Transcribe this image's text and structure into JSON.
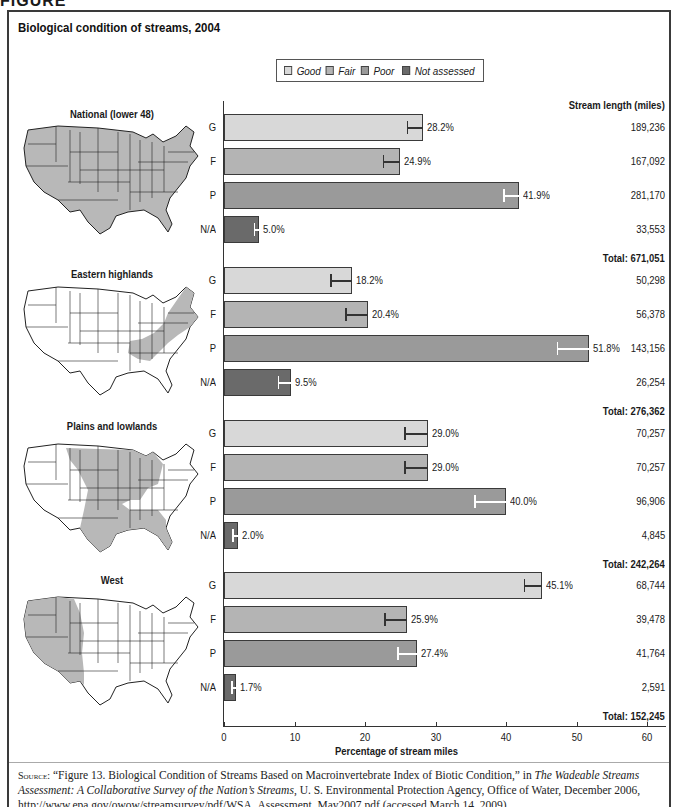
{
  "title": "Biological condition of streams, 2004",
  "legend": [
    {
      "label": "Good",
      "color": "#d8d8d8"
    },
    {
      "label": "Fair",
      "color": "#b4b4b4"
    },
    {
      "label": "Poor",
      "color": "#9a9a9a"
    },
    {
      "label": "Not assessed",
      "color": "#6a6a6a"
    }
  ],
  "column_header": "Stream length (miles)",
  "x_axis": {
    "title": "Percentage of stream miles",
    "ticks": [
      "0",
      "10",
      "20",
      "30",
      "40",
      "50",
      "60"
    ]
  },
  "regions": [
    {
      "name": "National (lower 48)",
      "rows": [
        {
          "cat": "G",
          "pct": "28.2%",
          "miles": "189,236"
        },
        {
          "cat": "F",
          "pct": "24.9%",
          "miles": "167,092"
        },
        {
          "cat": "P",
          "pct": "41.9%",
          "miles": "281,170"
        },
        {
          "cat": "N/A",
          "pct": "5.0%",
          "miles": "33,553"
        }
      ],
      "total": "Total: 671,051"
    },
    {
      "name": "Eastern highlands",
      "rows": [
        {
          "cat": "G",
          "pct": "18.2%",
          "miles": "50,298"
        },
        {
          "cat": "F",
          "pct": "20.4%",
          "miles": "56,378"
        },
        {
          "cat": "P",
          "pct": "51.8%",
          "miles": "143,156"
        },
        {
          "cat": "N/A",
          "pct": "9.5%",
          "miles": "26,254"
        }
      ],
      "total": "Total: 276,362"
    },
    {
      "name": "Plains and lowlands",
      "rows": [
        {
          "cat": "G",
          "pct": "29.0%",
          "miles": "70,257"
        },
        {
          "cat": "F",
          "pct": "29.0%",
          "miles": "70,257"
        },
        {
          "cat": "P",
          "pct": "40.0%",
          "miles": "96,906"
        },
        {
          "cat": "N/A",
          "pct": "2.0%",
          "miles": "4,845"
        }
      ],
      "total": "Total: 242,264"
    },
    {
      "name": "West",
      "rows": [
        {
          "cat": "G",
          "pct": "45.1%",
          "miles": "68,744"
        },
        {
          "cat": "F",
          "pct": "25.9%",
          "miles": "39,478"
        },
        {
          "cat": "P",
          "pct": "27.4%",
          "miles": "41,764"
        },
        {
          "cat": "N/A",
          "pct": "1.7%",
          "miles": "2,591"
        }
      ],
      "total": "Total: 152,245"
    }
  ],
  "source": {
    "prefix": "Source:",
    "part1": " “Figure 13. Biological Condition of Streams Based on Macroinvertebrate Index of Biotic Condition,” in ",
    "italic": "The Wadeable Streams Assessment: A Collaborative Survey of the Nation’s Streams",
    "part2": ", U. S. Environmental Protection Agency, Office of Water, December 2006, http://www.epa.gov/owow/streamsurvey/pdf/WSA_Assessment_May2007.pdf (accessed March 14, 2009)"
  },
  "chart_data": {
    "type": "bar",
    "orientation": "horizontal",
    "title": "Biological condition of streams, 2004",
    "xlabel": "Percentage of stream miles",
    "ylabel": "",
    "xlim": [
      0,
      60
    ],
    "xticks": [
      0,
      10,
      20,
      30,
      40,
      50,
      60
    ],
    "grid": false,
    "legend_position": "top",
    "categories": [
      "Good",
      "Fair",
      "Poor",
      "Not assessed"
    ],
    "category_abbrev": [
      "G",
      "F",
      "P",
      "N/A"
    ],
    "series": [
      {
        "name": "National (lower 48)",
        "values": [
          28.2,
          24.9,
          41.9,
          5.0
        ],
        "error_low": [
          25.9,
          22.5,
          39.6,
          4.2
        ],
        "stream_miles": [
          189236,
          167092,
          281170,
          33553
        ],
        "total_miles": 671051
      },
      {
        "name": "Eastern highlands",
        "values": [
          18.2,
          20.4,
          51.8,
          9.5
        ],
        "error_low": [
          15.1,
          17.2,
          47.2,
          7.6
        ],
        "stream_miles": [
          50298,
          56378,
          143156,
          26254
        ],
        "total_miles": 276362
      },
      {
        "name": "Plains and lowlands",
        "values": [
          29.0,
          29.0,
          40.0,
          2.0
        ],
        "error_low": [
          25.6,
          25.6,
          35.5,
          1.2
        ],
        "stream_miles": [
          70257,
          70257,
          96906,
          4845
        ],
        "total_miles": 242264
      },
      {
        "name": "West",
        "values": [
          45.1,
          25.9,
          27.4,
          1.7
        ],
        "error_low": [
          42.5,
          22.7,
          24.6,
          1.0
        ],
        "stream_miles": [
          68744,
          39478,
          41764,
          2591
        ],
        "total_miles": 152245
      }
    ],
    "annotations": [
      "Stream length (miles)"
    ]
  }
}
